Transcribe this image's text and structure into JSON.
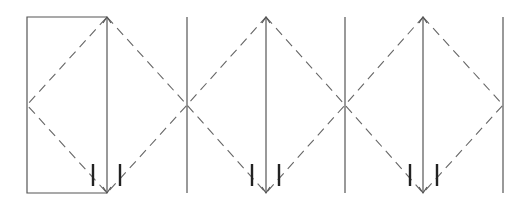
{
  "diagram": {
    "colors": {
      "background": "#ffffff",
      "solid_line": "#555555",
      "dashed_line": "#666666",
      "tick": "#222222"
    },
    "top_y": 17,
    "mid_y": 105,
    "bottom_y": 193,
    "rectangle": {
      "x1": 27,
      "x2": 107
    },
    "vertical_lines_x": [
      187,
      345,
      503
    ],
    "units": [
      {
        "left_x": 27,
        "center_x": 107,
        "right_x": 187,
        "ticks_x": [
          93,
          120
        ]
      },
      {
        "left_x": 187,
        "center_x": 266,
        "right_x": 345,
        "ticks_x": [
          252,
          279
        ]
      },
      {
        "left_x": 345,
        "center_x": 423,
        "right_x": 503,
        "ticks_x": [
          410,
          437
        ]
      }
    ],
    "tick": {
      "y1": 164,
      "y2": 186
    }
  }
}
